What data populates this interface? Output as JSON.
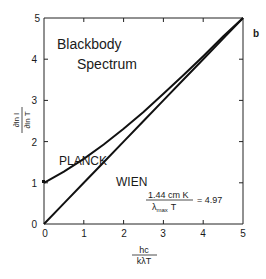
{
  "chart_data": {
    "type": "line",
    "panel_label": "b",
    "title": "Blackbody Spectrum",
    "title_lines": [
      "Blackbody",
      "Spectrum"
    ],
    "xlabel": "hc / kλT",
    "xlabel_num": "hc",
    "xlabel_den": "kλT",
    "ylabel": "∂ln I / ∂ln T",
    "ylabel_num": "∂ln I",
    "ylabel_den": "∂ln T",
    "xlim": [
      0,
      5
    ],
    "ylim": [
      0,
      5
    ],
    "xticks": [
      "0",
      "1",
      "2",
      "3",
      "4",
      "5"
    ],
    "yticks": [
      "0",
      "1",
      "2",
      "3",
      "4",
      "5"
    ],
    "grid": false,
    "x": [
      0,
      0.5,
      1,
      1.5,
      2,
      2.5,
      3,
      3.5,
      4,
      4.5,
      5
    ],
    "series": [
      {
        "name": "Planck",
        "label_display": "PLANCK",
        "values": [
          1.0,
          1.27,
          1.58,
          1.93,
          2.31,
          2.72,
          3.16,
          3.61,
          4.07,
          4.55,
          5.03
        ]
      },
      {
        "name": "Wien",
        "label_display": "WIEN",
        "values": [
          0,
          0.5,
          1,
          1.5,
          2,
          2.5,
          3,
          3.5,
          4,
          4.5,
          5
        ]
      }
    ],
    "annotations": [
      {
        "text": "1.44 cm K / (λmax T) = 4.97",
        "numerator": "1.44 cm K",
        "denominator_lambda": "λ",
        "denominator_sub": "max",
        "denominator_T": "T",
        "equals": "= 4.97"
      }
    ]
  }
}
